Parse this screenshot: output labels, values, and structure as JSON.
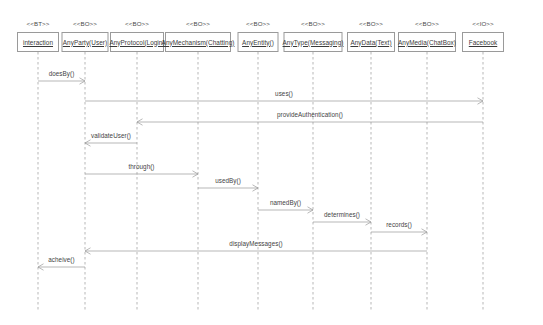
{
  "diagram": {
    "type": "uml-sequence-diagram",
    "title": "",
    "background_color": "#ffffff",
    "line_color": "#9a9a9a",
    "text_color": "#3a3a3a",
    "width": 543,
    "height": 325
  },
  "lifelines": [
    {
      "id": "interaction",
      "stereotype": "<<BT>>",
      "name": "interaction",
      "x": 38,
      "box_left": 18,
      "box_width": 42,
      "box_top": 32
    },
    {
      "id": "anyparty",
      "stereotype": "<<BO>>",
      "name": "AnyParty(User)",
      "x": 85,
      "box_left": 62,
      "box_width": 47,
      "box_top": 32
    },
    {
      "id": "anyprotocol",
      "stereotype": "<<BO>>",
      "name": "AnyProtocol(Login)",
      "x": 137,
      "box_left": 111,
      "box_width": 54,
      "box_top": 32
    },
    {
      "id": "anymechanism",
      "stereotype": "<<BO>>",
      "name": "AnyMechanism(Chatting)",
      "x": 198,
      "box_left": 166,
      "box_width": 66,
      "box_top": 32
    },
    {
      "id": "anyentity",
      "stereotype": "<<BO>>",
      "name": "AnyEntity()",
      "x": 258,
      "box_left": 238,
      "box_width": 41,
      "box_top": 32
    },
    {
      "id": "anytype",
      "stereotype": "<<BO>>",
      "name": "AnyType(Messaging)",
      "x": 313,
      "box_left": 285,
      "box_width": 59,
      "box_top": 32
    },
    {
      "id": "anydata",
      "stereotype": "<<BO>>",
      "name": "AnyData(Text)",
      "x": 371,
      "box_left": 348,
      "box_width": 48,
      "box_top": 32
    },
    {
      "id": "anymedia",
      "stereotype": "<<BO>>",
      "name": "AnyMedia(ChatBox)",
      "x": 427,
      "box_left": 399,
      "box_width": 58,
      "box_top": 32
    },
    {
      "id": "facebook",
      "stereotype": "<<IO>>",
      "name": "Facebook",
      "x": 483,
      "box_left": 462,
      "box_width": 42,
      "box_top": 32
    }
  ],
  "messages": [
    {
      "id": "m1",
      "label": "doesBy()",
      "from": "interaction",
      "to": "anyparty",
      "y": 81,
      "direction": "right"
    },
    {
      "id": "m2",
      "label": "uses()",
      "from": "anyparty",
      "to": "facebook",
      "y": 101,
      "direction": "right"
    },
    {
      "id": "m3",
      "label": "provideAuthentication()",
      "from": "facebook",
      "to": "anyprotocol",
      "y": 122,
      "direction": "left"
    },
    {
      "id": "m4",
      "label": "validateUser()",
      "from": "anyprotocol",
      "to": "anyparty",
      "y": 143,
      "direction": "left"
    },
    {
      "id": "m5",
      "label": "through()",
      "from": "anyparty",
      "to": "anymechanism",
      "y": 174,
      "direction": "right"
    },
    {
      "id": "m6",
      "label": "usedBy()",
      "from": "anymechanism",
      "to": "anyentity",
      "y": 188,
      "direction": "right"
    },
    {
      "id": "m7",
      "label": "namedBy()",
      "from": "anyentity",
      "to": "anytype",
      "y": 210,
      "direction": "right"
    },
    {
      "id": "m8",
      "label": "determines()",
      "from": "anytype",
      "to": "anydata",
      "y": 222,
      "direction": "right"
    },
    {
      "id": "m9",
      "label": "records()",
      "from": "anydata",
      "to": "anymedia",
      "y": 232,
      "direction": "right"
    },
    {
      "id": "m10",
      "label": "displayMessages()",
      "from": "anymedia",
      "to": "anyparty",
      "y": 251,
      "direction": "left"
    },
    {
      "id": "m11",
      "label": "acheive()",
      "from": "anyparty",
      "to": "interaction",
      "y": 267,
      "direction": "left"
    }
  ],
  "lifeline_extent": {
    "top": 52,
    "bottom": 310
  }
}
